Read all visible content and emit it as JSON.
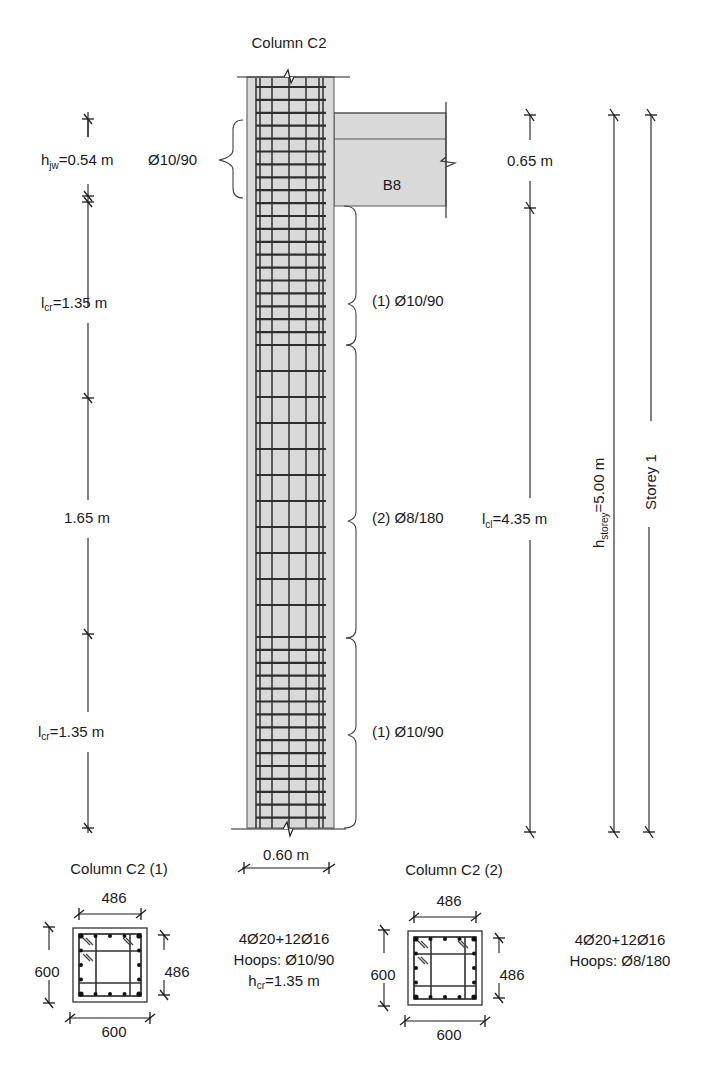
{
  "elevation": {
    "title": "Column C2",
    "beam_label": "B8",
    "column_width_label": "0.60 m",
    "left_dims": [
      {
        "main": "h",
        "sub": "jw",
        "rest": "=0.54 m"
      },
      {
        "main": "l",
        "sub": "cr",
        "rest": "=1.35 m"
      },
      {
        "main": "",
        "sub": "",
        "rest": "1.65 m"
      },
      {
        "main": "l",
        "sub": "cr",
        "rest": "=1.35 m"
      }
    ],
    "joint_hoops": "Ø10/90",
    "zone_labels": [
      "(1) Ø10/90",
      "(2) Ø8/180",
      "(1) Ø10/90"
    ],
    "right_dims": {
      "beam_depth": "0.65 m",
      "clear_height": {
        "main": "l",
        "sub": "cl",
        "rest": "=4.35 m"
      },
      "storey_height": {
        "main": "h",
        "sub": "storey",
        "rest": "=5.00 m"
      },
      "storey_label": "Storey 1"
    }
  },
  "sections": [
    {
      "title": "Column C2 (1)",
      "dim_top": "486",
      "dim_left": "600",
      "dim_right": "486",
      "dim_bottom": "600",
      "reinforcement": "4Ø20+12Ø16",
      "hoops": "Hoops: Ø10/90",
      "hcr": {
        "main": "h",
        "sub": "cr",
        "rest": "=1.35 m"
      }
    },
    {
      "title": "Column C2 (2)",
      "dim_top": "486",
      "dim_left": "600",
      "dim_right": "486",
      "dim_bottom": "600",
      "reinforcement": "4Ø20+12Ø16",
      "hoops": "Hoops: Ø8/180"
    }
  ],
  "colors": {
    "concrete": "#d9d9d9",
    "lines": "#1a1a1a"
  }
}
